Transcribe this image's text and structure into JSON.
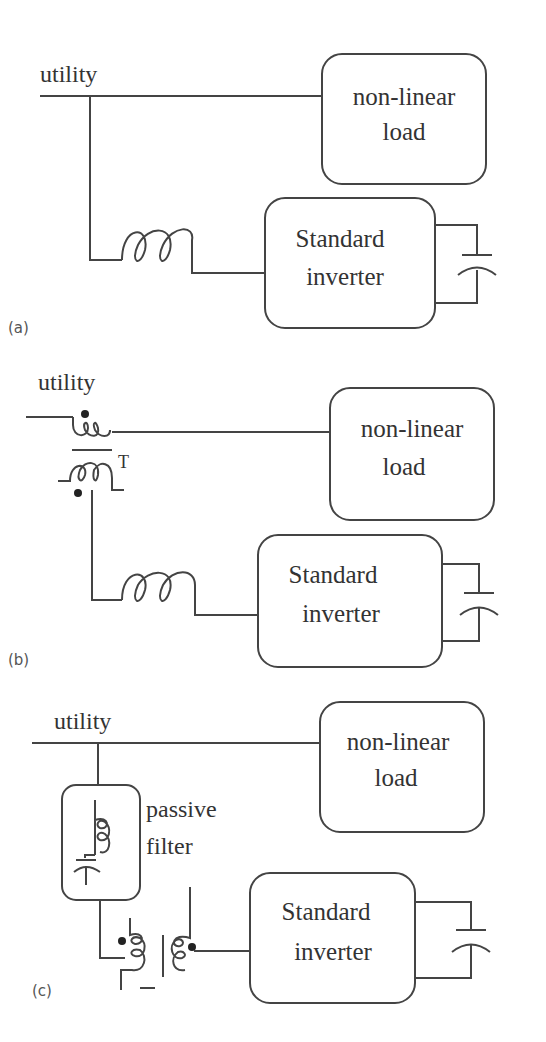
{
  "panels": [
    {
      "id": "a",
      "caption": "(a)",
      "utility_label": "utility",
      "load_label_line1": "non-linear",
      "load_label_line2": "load",
      "inverter_label_line1": "Standard",
      "inverter_label_line2": "inverter"
    },
    {
      "id": "b",
      "caption": "(b)",
      "utility_label": "utility",
      "transformer_label": "T",
      "load_label_line1": "non-linear",
      "load_label_line2": "load",
      "inverter_label_line1": "Standard",
      "inverter_label_line2": "inverter"
    },
    {
      "id": "c",
      "caption": "(c)",
      "utility_label": "utility",
      "filter_label_line1": "passive",
      "filter_label_line2": "filter",
      "load_label_line1": "non-linear",
      "load_label_line2": "load",
      "inverter_label_line1": "Standard",
      "inverter_label_line2": "inverter"
    }
  ],
  "colors": {
    "line": "#444444",
    "text": "#333333",
    "background": "#ffffff"
  }
}
